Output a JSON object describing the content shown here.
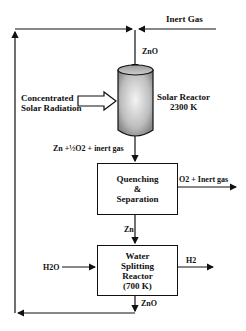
{
  "diagram": {
    "inputs": {
      "inert_gas": "Inert Gas",
      "zno_feed": "ZnO",
      "radiation": "Concentrated\nSolar Radiation",
      "water": "H2O"
    },
    "solar_reactor": {
      "label": "Solar Reactor",
      "temp": "2300 K"
    },
    "reactor_outflow": "Zn +½O2 + inert gas",
    "quench": {
      "label": "Quenching\n&\nSeparation",
      "output": "O2 + Inert gas",
      "product": "Zn"
    },
    "water_reactor": {
      "label": "Water\nSplitting\nReactor\n(700 K)",
      "output": "H2",
      "recycle": "ZnO"
    }
  }
}
